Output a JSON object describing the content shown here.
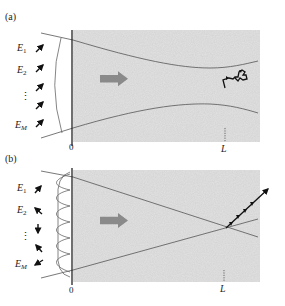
{
  "figure": {
    "panels": [
      {
        "label": "(a)",
        "field_labels": [
          "E",
          "E",
          "E"
        ],
        "field_subscripts": [
          "1",
          "2",
          "M"
        ],
        "ellipsis": "⋮",
        "origin_label": "0",
        "length_label": "L",
        "description": "Plane-wave inputs with uniform polarization focused into scattering medium; output at L is a random-walk polarization"
      },
      {
        "label": "(b)",
        "field_labels": [
          "E",
          "E",
          "E"
        ],
        "field_subscripts": [
          "1",
          "2",
          "M"
        ],
        "ellipsis": "⋮",
        "origin_label": "0",
        "length_label": "L",
        "description": "Shaped wavefront with varied polarizations focused into scattering medium; output at L is a linear, aligned polarization"
      }
    ],
    "colors": {
      "medium_fill": "#d9d9d9",
      "line": "#555555",
      "arrow": "#111111",
      "propagation_arrow": "#8a8a8a"
    }
  }
}
